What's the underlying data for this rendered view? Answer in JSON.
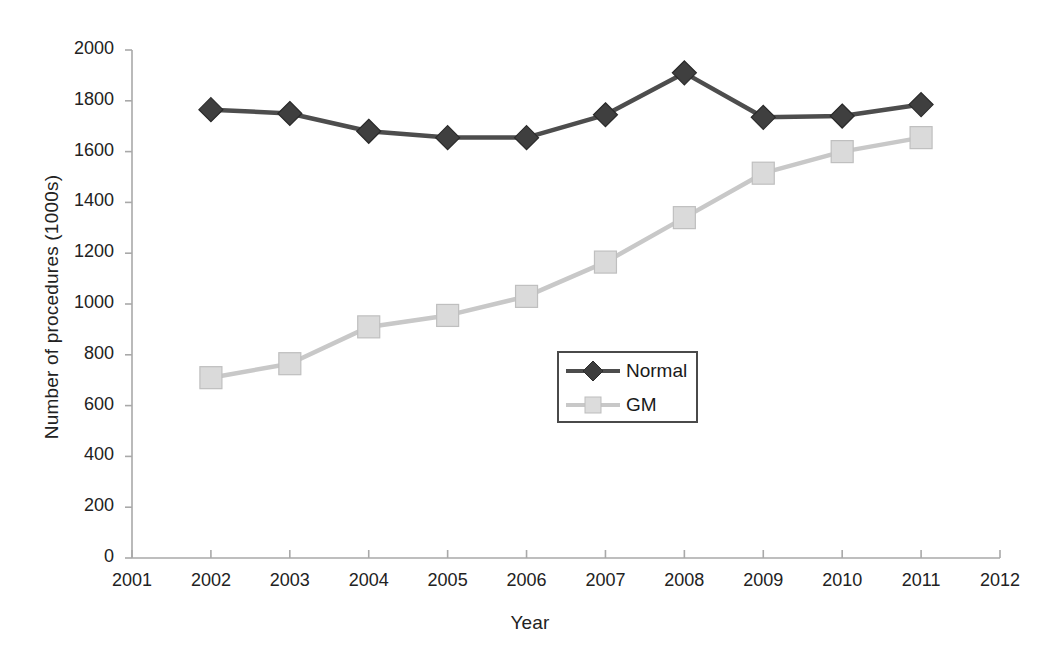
{
  "chart_data": {
    "type": "line",
    "title": "",
    "xlabel": "Year",
    "ylabel": "Number of procedures (1000s)",
    "x": [
      2002,
      2003,
      2004,
      2005,
      2006,
      2007,
      2008,
      2009,
      2010,
      2011
    ],
    "xlim": [
      2001,
      2012
    ],
    "ylim": [
      0,
      2000
    ],
    "xticks": [
      "2001",
      "2002",
      "2003",
      "2004",
      "2005",
      "2006",
      "2007",
      "2008",
      "2009",
      "2010",
      "2011",
      "2012"
    ],
    "yticks": [
      "0",
      "200",
      "400",
      "600",
      "800",
      "1000",
      "1200",
      "1400",
      "1600",
      "1800",
      "2000"
    ],
    "grid": false,
    "legend_position": "center",
    "series": [
      {
        "name": "Normal",
        "marker": "diamond",
        "color": "#4d4d4d",
        "values": [
          1765,
          1750,
          1680,
          1655,
          1655,
          1745,
          1910,
          1735,
          1740,
          1785
        ]
      },
      {
        "name": "GM",
        "marker": "square",
        "color": "#c8c8c8",
        "values": [
          710,
          765,
          910,
          955,
          1030,
          1165,
          1340,
          1515,
          1600,
          1655
        ]
      }
    ]
  },
  "legend": {
    "items": [
      {
        "label": "Normal",
        "marker": "diamond-marker-icon"
      },
      {
        "label": "GM",
        "marker": "square-marker-icon"
      }
    ]
  },
  "colors": {
    "normal_series": "#4d4d4d",
    "gm_series": "#c8c8c8",
    "axis": "#a9a9a9",
    "text": "#1a1a1a"
  }
}
